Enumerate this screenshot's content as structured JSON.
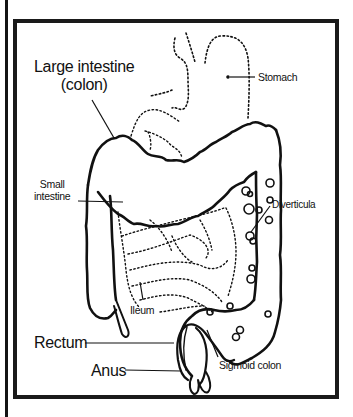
{
  "figure": {
    "labels": {
      "large_intestine": "Large intestine",
      "colon": "(colon)",
      "stomach": "Stomach",
      "small_intestine_1": "Small",
      "small_intestine_2": "intestine",
      "diverticula": "Diverticula",
      "ileum": "Ileum",
      "rectum": "Rectum",
      "anus": "Anus",
      "sigmoid_colon": "Sigmoid colon"
    },
    "colors": {
      "line": "#111111",
      "background": "#ffffff"
    }
  }
}
